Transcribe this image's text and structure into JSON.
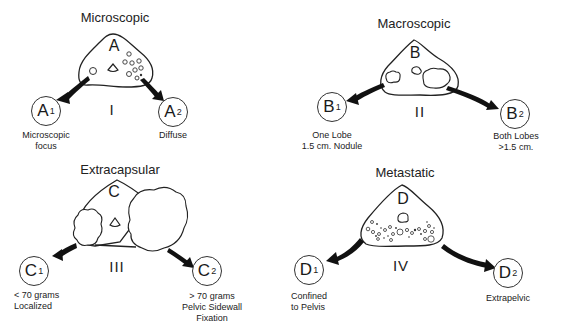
{
  "stages": [
    {
      "id": "A",
      "title": "Microscopic",
      "stage_letter": "A",
      "roman": "I",
      "sub1": {
        "letter": "A",
        "index": "1",
        "lines": [
          "Microscopic",
          "focus"
        ]
      },
      "sub2": {
        "letter": "A",
        "index": "2",
        "lines": [
          "Diffuse"
        ]
      }
    },
    {
      "id": "B",
      "title": "Macroscopic",
      "stage_letter": "B",
      "roman": "II",
      "sub1": {
        "letter": "B",
        "index": "1",
        "lines": [
          "One Lobe",
          "1.5 cm. Nodule"
        ]
      },
      "sub2": {
        "letter": "B",
        "index": "2",
        "lines": [
          "Both Lobes",
          ">1.5 cm."
        ]
      }
    },
    {
      "id": "C",
      "title": "Extracapsular",
      "stage_letter": "C",
      "roman": "III",
      "sub1": {
        "letter": "C",
        "index": "1",
        "lines": [
          "< 70 grams",
          "Localized"
        ]
      },
      "sub2": {
        "letter": "C",
        "index": "2",
        "lines": [
          "> 70 grams",
          "Pelvic Sidewall",
          "Fixation"
        ]
      }
    },
    {
      "id": "D",
      "title": "Metastatic",
      "stage_letter": "D",
      "roman": "IV",
      "sub1": {
        "letter": "D",
        "index": "1",
        "lines": [
          "Confined",
          "to Pelvis"
        ]
      },
      "sub2": {
        "letter": "D",
        "index": "2",
        "lines": [
          "Extrapelvic"
        ]
      }
    }
  ],
  "colors": {
    "ink": "#1a1a1a",
    "background": "#ffffff"
  }
}
